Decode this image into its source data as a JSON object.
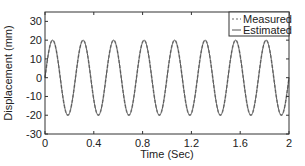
{
  "chart_data": {
    "type": "line",
    "title": "",
    "xlabel": "Time (Sec)",
    "ylabel": "Displacement (mm)",
    "xlim": [
      0,
      2
    ],
    "ylim": [
      -30,
      35
    ],
    "xticks": [
      0,
      0.4,
      0.8,
      1.2,
      1.6,
      2
    ],
    "xtick_labels": [
      "0",
      "0.4",
      "0.8",
      "1.2",
      "1.6",
      "2"
    ],
    "yticks": [
      -30,
      -20,
      -10,
      0,
      10,
      20,
      30
    ],
    "ytick_labels": [
      "-30",
      "-20",
      "-10",
      "0",
      "10",
      "20",
      "30"
    ],
    "grid": false,
    "legend_position": "upper right",
    "series": [
      {
        "name": "Measured",
        "style": "dashed",
        "color": "#9a9a9a",
        "function": "20*sin(2*pi*4*t)",
        "amplitude": 20,
        "frequency_hz": 4,
        "x": [
          0,
          0.0625,
          0.125,
          0.1875,
          0.25,
          0.3125,
          0.375,
          0.4375,
          0.5,
          0.5625,
          0.625,
          0.6875,
          0.75,
          0.8125,
          0.875,
          0.9375,
          1.0,
          1.0625,
          1.125,
          1.1875,
          1.25,
          1.3125,
          1.375,
          1.4375,
          1.5,
          1.5625,
          1.625,
          1.6875,
          1.75,
          1.8125,
          1.875,
          1.9375,
          2.0
        ],
        "values": [
          0,
          20,
          0,
          -20,
          0,
          20,
          0,
          -20,
          0,
          20,
          0,
          -20,
          0,
          20,
          0,
          -20,
          0,
          20,
          0,
          -20,
          0,
          20,
          0,
          -20,
          0,
          20,
          0,
          -20,
          0,
          20,
          0,
          -20,
          0
        ]
      },
      {
        "name": "Estimated",
        "style": "solid",
        "color": "#555555",
        "function": "20*sin(2*pi*4*t)",
        "amplitude": 20,
        "frequency_hz": 4,
        "x": [
          0,
          0.0625,
          0.125,
          0.1875,
          0.25,
          0.3125,
          0.375,
          0.4375,
          0.5,
          0.5625,
          0.625,
          0.6875,
          0.75,
          0.8125,
          0.875,
          0.9375,
          1.0,
          1.0625,
          1.125,
          1.1875,
          1.25,
          1.3125,
          1.375,
          1.4375,
          1.5,
          1.5625,
          1.625,
          1.6875,
          1.75,
          1.8125,
          1.875,
          1.9375,
          2.0
        ],
        "values": [
          0,
          20,
          0,
          -20,
          0,
          20,
          0,
          -20,
          0,
          20,
          0,
          -20,
          0,
          20,
          0,
          -20,
          0,
          20,
          0,
          -20,
          0,
          20,
          0,
          -20,
          0,
          20,
          0,
          -20,
          0,
          20,
          0,
          -20,
          0
        ]
      }
    ]
  },
  "legend": {
    "items": [
      {
        "label": "Measured"
      },
      {
        "label": "Estimated"
      }
    ]
  }
}
